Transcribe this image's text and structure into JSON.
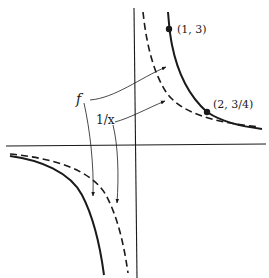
{
  "diagram": {
    "labels": {
      "f": "f",
      "one_over_x": "1/x",
      "point1": "(1, 3)",
      "point2": "(2, 3/4)"
    },
    "points": [
      {
        "label": "(1, 3)",
        "x": 1,
        "y": 3
      },
      {
        "label": "(2, 3/4)",
        "x": 2,
        "y": 0.75
      }
    ],
    "curves": [
      {
        "name": "f",
        "style": "solid"
      },
      {
        "name": "1/x",
        "style": "dashed"
      }
    ],
    "colors": {
      "ink": "#1a1a1a",
      "background": "#ffffff"
    }
  }
}
